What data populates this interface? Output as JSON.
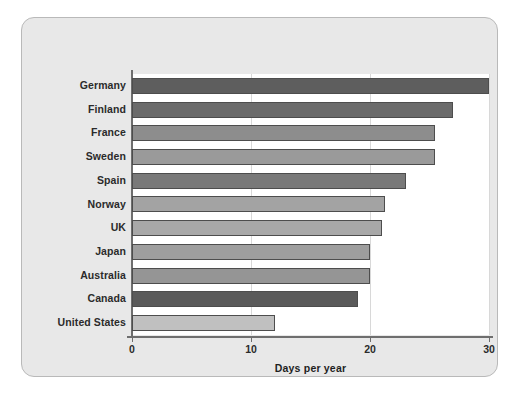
{
  "chart_data": {
    "type": "bar",
    "orientation": "horizontal",
    "title": "",
    "xlabel": "Days per year",
    "ylabel": "",
    "xlim": [
      0,
      30
    ],
    "xticks": [
      0,
      10,
      20,
      30
    ],
    "xtick_labels": [
      "0",
      "10",
      "20",
      "30"
    ],
    "grid": true,
    "grid_axis": "x",
    "legend": "none",
    "categories": [
      "Germany",
      "Finland",
      "France",
      "Sweden",
      "Spain",
      "Norway",
      "UK",
      "Japan",
      "Australia",
      "Canada",
      "United States"
    ],
    "values": [
      30,
      27,
      25.5,
      25.5,
      23,
      21.3,
      21,
      20,
      20,
      19,
      12
    ],
    "bar_colors": [
      "#5e5e5e",
      "#6b6b6b",
      "#8d8d8d",
      "#9a9a9a",
      "#797979",
      "#a3a3a3",
      "#a8a8a8",
      "#9e9e9e",
      "#959595",
      "#5a5a5a",
      "#c0c0c0"
    ],
    "bar_edge_color": "#4d4d4d",
    "plot_background": "#ffffff",
    "panel_background": "#e8e8e8",
    "axis_color": "#6e6e6e",
    "gridline_color": "#d8d8d8",
    "text_color": "#2b2b2b"
  }
}
